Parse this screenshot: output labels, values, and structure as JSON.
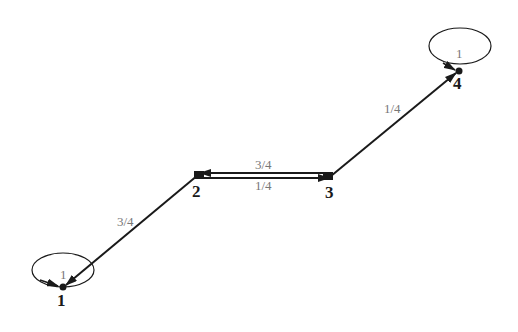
{
  "diagram": {
    "type": "markov-chain-state-diagram",
    "colors": {
      "edge": "#1a1a1a",
      "label": "#777777",
      "node": "#1a1a1a",
      "background": "#ffffff"
    },
    "nodes": [
      {
        "id": "1",
        "label": "1",
        "x": 63,
        "y": 287
      },
      {
        "id": "2",
        "label": "2",
        "x": 198,
        "y": 175
      },
      {
        "id": "3",
        "label": "3",
        "x": 331,
        "y": 176
      },
      {
        "id": "4",
        "label": "4",
        "x": 459,
        "y": 71
      }
    ],
    "edges": [
      {
        "from": "1",
        "to": "1",
        "label": "1",
        "self_loop": true
      },
      {
        "from": "2",
        "to": "1",
        "label": "3/4"
      },
      {
        "from": "2",
        "to": "3",
        "label": "1/4"
      },
      {
        "from": "3",
        "to": "2",
        "label": "3/4"
      },
      {
        "from": "3",
        "to": "4",
        "label": "1/4"
      },
      {
        "from": "4",
        "to": "4",
        "label": "1",
        "self_loop": true
      }
    ]
  }
}
